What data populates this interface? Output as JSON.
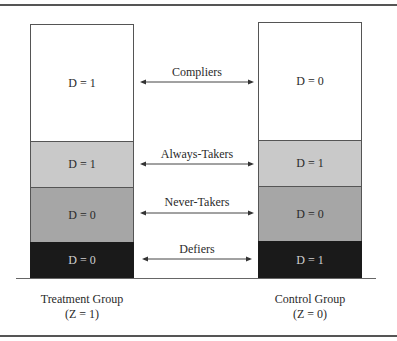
{
  "diagram": {
    "type": "compliance-types-stacked-columns",
    "colors": {
      "compliers": "#ffffff",
      "always_takers": "#c9c9c9",
      "never_takers": "#a6a6a6",
      "defiers": "#1a1a1a"
    },
    "treatment_group": {
      "label_line1": "Treatment Group",
      "label_line2": "(Z = 1)",
      "segments": [
        {
          "type": "compliers",
          "text": "D = 1"
        },
        {
          "type": "always_takers",
          "text": "D = 1"
        },
        {
          "type": "never_takers",
          "text": "D = 0"
        },
        {
          "type": "defiers",
          "text": "D = 0"
        }
      ]
    },
    "control_group": {
      "label_line1": "Control Group",
      "label_line2": "(Z = 0)",
      "segments": [
        {
          "type": "compliers",
          "text": "D = 0"
        },
        {
          "type": "always_takers",
          "text": "D = 1"
        },
        {
          "type": "never_takers",
          "text": "D = 0"
        },
        {
          "type": "defiers",
          "text": "D = 1"
        }
      ]
    },
    "arrows": [
      {
        "label": "Compliers"
      },
      {
        "label": "Always-Takers"
      },
      {
        "label": "Never-Takers"
      },
      {
        "label": "Defiers"
      }
    ]
  }
}
